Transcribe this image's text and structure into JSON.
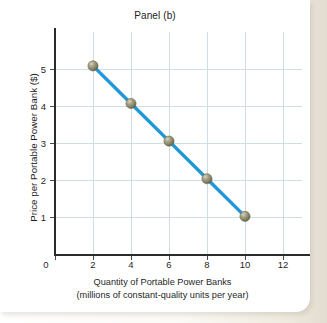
{
  "figure": {
    "title": "Panel (b)",
    "background_color": "#ffffff",
    "paper_color": "#e8e4da"
  },
  "chart_data": {
    "type": "line",
    "title": "Panel (b)",
    "xlabel": "Quantity of Portable Power Banks",
    "xlabel_line2": "(millions of constant-quality units per year)",
    "ylabel": "Price per Portable Power Bank ($)",
    "x": [
      2,
      4,
      6,
      8,
      10
    ],
    "values": [
      5,
      4,
      3,
      2,
      1
    ],
    "series": [
      {
        "name": "Demand",
        "x": [
          2,
          4,
          6,
          8,
          10
        ],
        "values": [
          5,
          4,
          3,
          2,
          1
        ]
      }
    ],
    "points": [
      {
        "x": 2,
        "y": 5
      },
      {
        "x": 4,
        "y": 4
      },
      {
        "x": 6,
        "y": 3
      },
      {
        "x": 8,
        "y": 2
      },
      {
        "x": 10,
        "y": 1
      }
    ],
    "xticks": [
      0,
      2,
      4,
      6,
      8,
      10,
      12
    ],
    "xticklabels": [
      "0",
      "2",
      "4",
      "6",
      "8",
      "10",
      "12"
    ],
    "yticks": [
      1,
      2,
      3,
      4,
      5
    ],
    "yticklabels": [
      "1",
      "2",
      "3",
      "4",
      "5"
    ],
    "xlim": [
      0,
      13
    ],
    "ylim": [
      0,
      5.9
    ],
    "grid": true,
    "grid_color": "#cddfe3",
    "legend": null,
    "line_color": "#2196d8",
    "marker_color": "#8c8a6e",
    "marker_shape": "sphere"
  }
}
